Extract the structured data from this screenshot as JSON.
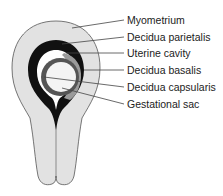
{
  "diagram": {
    "labels": [
      {
        "id": "myometrium",
        "text": "Myometrium"
      },
      {
        "id": "decidua-parietalis",
        "text": "Decidua parietalis"
      },
      {
        "id": "uterine-cavity",
        "text": "Uterine cavity"
      },
      {
        "id": "decidua-basalis",
        "text": "Decidua basalis"
      },
      {
        "id": "decidua-capsularis",
        "text": "Decidua capsularis"
      },
      {
        "id": "gestational-sac",
        "text": "Gestational sac"
      }
    ],
    "colors": {
      "myometrium": "#e2e2e2",
      "decidua_parietalis": "#111111",
      "uterine_cavity": "#ffffff",
      "decidua_basalis": "#9a9a9a",
      "decidua_capsularis": "#555555",
      "gestational_sac": "#f4f4f4",
      "outline": "#555555",
      "leader": "#444444"
    }
  }
}
